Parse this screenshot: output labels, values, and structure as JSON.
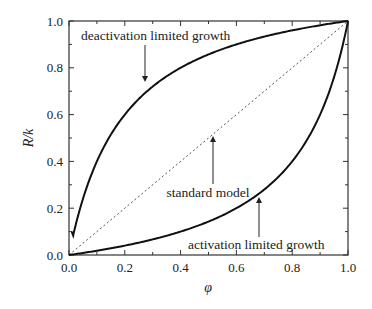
{
  "chart_data": {
    "type": "line",
    "title": "",
    "xlabel": "φ",
    "ylabel": "R/k",
    "xlim": [
      0.0,
      1.0
    ],
    "ylim": [
      0.0,
      1.0
    ],
    "grid": false,
    "legend": null,
    "x_ticks": [
      "0.0",
      "0.2",
      "0.4",
      "0.6",
      "0.8",
      "1.0"
    ],
    "y_ticks": [
      "0.0",
      "0.2",
      "0.4",
      "0.6",
      "0.8",
      "1.0"
    ],
    "series": [
      {
        "name": "deactivation limited growth",
        "style": "solid",
        "x": [
          0.01,
          0.02,
          0.05,
          0.1,
          0.15,
          0.2,
          0.3,
          0.4,
          0.5,
          0.6,
          0.7,
          0.8,
          0.9,
          1.0
        ],
        "y": [
          0.1,
          0.17,
          0.32,
          0.5,
          0.6,
          0.66,
          0.74,
          0.8,
          0.84,
          0.88,
          0.92,
          0.95,
          0.98,
          1.0
        ]
      },
      {
        "name": "standard model",
        "style": "dotted",
        "x": [
          0.0,
          1.0
        ],
        "y": [
          0.0,
          1.0
        ]
      },
      {
        "name": "activation limited growth",
        "style": "solid",
        "x": [
          0.0,
          0.1,
          0.2,
          0.3,
          0.4,
          0.5,
          0.6,
          0.7,
          0.8,
          0.85,
          0.9,
          0.95,
          1.0
        ],
        "y": [
          0.0,
          0.02,
          0.04,
          0.07,
          0.1,
          0.14,
          0.2,
          0.28,
          0.4,
          0.49,
          0.6,
          0.76,
          1.0
        ]
      }
    ],
    "annotations": [
      {
        "text": "deactivation limited growth",
        "arrow_to": [
          0.28,
          0.72
        ],
        "text_pos": [
          0.05,
          0.92
        ]
      },
      {
        "text": "standard model",
        "arrow_to": [
          0.52,
          0.52
        ],
        "text_pos": [
          0.36,
          0.22
        ]
      },
      {
        "text": "activation limited growth",
        "arrow_to": [
          0.68,
          0.26
        ],
        "text_pos": [
          0.48,
          0.03
        ]
      }
    ]
  }
}
